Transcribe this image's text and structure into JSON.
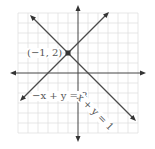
{
  "figure": {
    "type": "coordinate-graph",
    "grid": {
      "xmin": -6,
      "xmax": 6,
      "ymin": -6,
      "ymax": 6,
      "unit_px": 10
    },
    "colors": {
      "grid": "#dcdcdc",
      "axis": "#444444",
      "line": "#4a4a4a",
      "point": "#333333",
      "text": "#555555"
    },
    "lines": [
      {
        "equation": "-x + y = 3",
        "label": "−x + y = 3"
      },
      {
        "equation": "x + y = 1",
        "label": "x + y = 1"
      }
    ],
    "intersection": {
      "x": -1,
      "y": 2,
      "label": "(−1, 2)"
    }
  }
}
